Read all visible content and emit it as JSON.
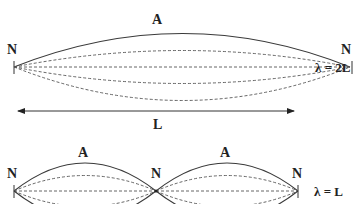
{
  "diagram": {
    "top": {
      "node_left_label": "N",
      "node_right_label": "N",
      "antinode_label": "A",
      "wavelength_label": "λ = 2L",
      "length_label": "L"
    },
    "bottom": {
      "node_left_label": "N",
      "node_middle_label": "N",
      "node_right_label": "N",
      "antinode_1_label": "A",
      "antinode_2_label": "A",
      "wavelength_label": "λ = L"
    },
    "colors": {
      "line": "#3a3a3a",
      "text": "#222222",
      "background": "#ffffff"
    }
  }
}
